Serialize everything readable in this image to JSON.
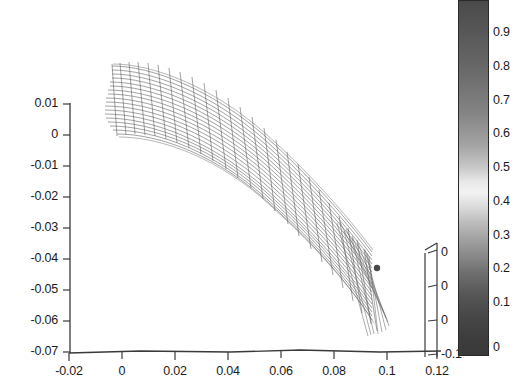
{
  "figure": {
    "background_color": "#ffffff",
    "axis_color": "#3a3a3a",
    "text_color": "#1a1a1a"
  },
  "chart_data": {
    "type": "line",
    "title": "",
    "xlabel": "",
    "ylabel": "",
    "grid": false,
    "legend": "none",
    "xlim": [
      -0.02,
      0.13
    ],
    "ylim": [
      -0.07,
      0.015
    ],
    "x_ticks": [
      -0.02,
      0,
      0.02,
      0.04,
      0.06,
      0.08,
      0.1,
      0.12
    ],
    "x_tick_labels": [
      "-0.02",
      "0",
      "0.02",
      "0.04",
      "0.06",
      "0.08",
      "0.1",
      "0.12"
    ],
    "y_ticks": [
      0.01,
      0,
      -0.01,
      -0.02,
      -0.03,
      -0.04,
      -0.05,
      -0.06,
      -0.07
    ],
    "y_tick_labels": [
      "0.01",
      "0",
      "-0.01",
      "-0.02",
      "-0.03",
      "-0.04",
      "-0.05",
      "-0.06",
      "-0.07"
    ],
    "secondary_axis": {
      "name": "z-axis",
      "tick_labels": [
        "0",
        "0",
        "0",
        "-0.1"
      ],
      "note": "third 3D axis, partially occluded by the colorbar"
    },
    "colorbar": {
      "orientation": "vertical",
      "vmin": 0,
      "vmax": 1,
      "tick_labels": [
        "0.9",
        "0.8",
        "0.7",
        "0.6",
        "0.5",
        "0.4",
        "0.3",
        "0.2",
        "0.1",
        "0"
      ],
      "tick_values": [
        0.9,
        0.8,
        0.7,
        0.6,
        0.5,
        0.4,
        0.3,
        0.2,
        0.1,
        0
      ],
      "colormap": "gray-banded"
    },
    "series": [
      {
        "name": "beam centerline (upper edge)",
        "x": [
          0.008,
          0.017,
          0.027,
          0.037,
          0.047,
          0.057,
          0.067,
          0.077,
          0.087,
          0.097,
          0.104
        ],
        "y": [
          0.012,
          0.011,
          0.009,
          0.005,
          0.0,
          -0.006,
          -0.013,
          -0.021,
          -0.029,
          -0.036,
          -0.04
        ]
      },
      {
        "name": "beam centerline (lower edge)",
        "x": [
          0.008,
          0.017,
          0.027,
          0.037,
          0.047,
          0.057,
          0.067,
          0.077,
          0.087,
          0.097,
          0.104
        ],
        "y": [
          0.002,
          0.0,
          -0.003,
          -0.007,
          -0.013,
          -0.019,
          -0.026,
          -0.034,
          -0.042,
          -0.05,
          -0.055
        ]
      }
    ]
  },
  "ticks": {
    "y": [
      {
        "label": "0.01",
        "px": 104
      },
      {
        "label": "0",
        "px": 135
      },
      {
        "label": "-0.01",
        "px": 166
      },
      {
        "label": "-0.02",
        "px": 197
      },
      {
        "label": "-0.03",
        "px": 228
      },
      {
        "label": "-0.04",
        "px": 259
      },
      {
        "label": "-0.05",
        "px": 290
      },
      {
        "label": "-0.06",
        "px": 321
      },
      {
        "label": "-0.07",
        "px": 352
      }
    ],
    "x": [
      {
        "label": "-0.02",
        "px": 69
      },
      {
        "label": "0",
        "px": 122
      },
      {
        "label": "0.02",
        "px": 175
      },
      {
        "label": "0.04",
        "px": 228
      },
      {
        "label": "0.06",
        "px": 281
      },
      {
        "label": "0.08",
        "px": 334
      },
      {
        "label": "0.1",
        "px": 387
      },
      {
        "label": "0.12",
        "px": 437
      }
    ],
    "z": [
      {
        "label": "0",
        "px": 253
      },
      {
        "label": "0",
        "px": 287
      },
      {
        "label": "0",
        "px": 321
      },
      {
        "label": "-0.1",
        "px": 355
      }
    ],
    "colorbar": [
      {
        "label": "0.9",
        "px": 33
      },
      {
        "label": "0.8",
        "px": 67
      },
      {
        "label": "0.7",
        "px": 101
      },
      {
        "label": "0.6",
        "px": 134
      },
      {
        "label": "0.5",
        "px": 168
      },
      {
        "label": "0.4",
        "px": 202
      },
      {
        "label": "0.3",
        "px": 236
      },
      {
        "label": "0.2",
        "px": 269
      },
      {
        "label": "0.1",
        "px": 303
      },
      {
        "label": "0",
        "px": 348
      }
    ]
  }
}
